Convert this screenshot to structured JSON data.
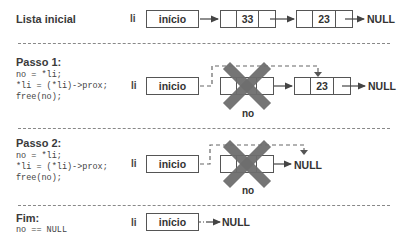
{
  "rows": {
    "initial": {
      "label": "Lista inicial",
      "pointer": "li",
      "head_box": "início",
      "nodes": [
        "33",
        "23"
      ],
      "terminal": "NULL"
    },
    "step1": {
      "label": "Passo 1:",
      "code": [
        "no = *li;",
        "*li = (*li)->prox;",
        "free(no);"
      ],
      "pointer": "li",
      "head_box": "inicio",
      "removed_node_label": "no",
      "nodes": [
        "23"
      ],
      "terminal": "NULL"
    },
    "step2": {
      "label": "Passo 2:",
      "code": [
        "no = *li;",
        "*li = (*li)->prox;",
        "free(no);"
      ],
      "pointer": "li",
      "head_box": "inicio",
      "removed_node_label": "no",
      "terminal": "NULL"
    },
    "end": {
      "label": "Fim:",
      "code": [
        "no == NULL"
      ],
      "pointer": "li",
      "head_box": "início",
      "terminal": "NULL"
    }
  },
  "colors": {
    "border": "#555555",
    "cross": "#6e6e6e",
    "separator": "#888888",
    "text": "#333333"
  }
}
